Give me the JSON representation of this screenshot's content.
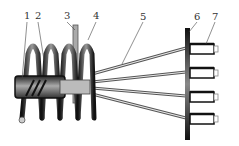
{
  "diagram": {
    "type": "technical-schematic",
    "labels": [
      {
        "id": "1",
        "text": "1",
        "x": 24,
        "y": 11
      },
      {
        "id": "2",
        "text": "2",
        "x": 35,
        "y": 11
      },
      {
        "id": "3",
        "text": "3",
        "x": 64,
        "y": 11
      },
      {
        "id": "4",
        "text": "4",
        "x": 93,
        "y": 11
      },
      {
        "id": "5",
        "text": "5",
        "x": 140,
        "y": 12
      },
      {
        "id": "6",
        "text": "6",
        "x": 194,
        "y": 12
      },
      {
        "id": "7",
        "text": "7",
        "x": 212,
        "y": 12
      }
    ],
    "components": {
      "coil_turns": 5,
      "wires": 4,
      "terminals": 4
    },
    "colors": {
      "dark": "#1a1a1a",
      "mid": "#777777",
      "light": "#d8d8d8",
      "line": "#444444"
    }
  }
}
